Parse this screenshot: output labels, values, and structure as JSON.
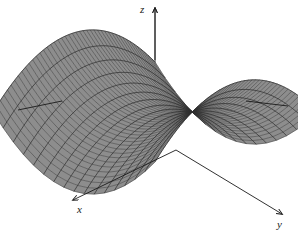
{
  "figure": {
    "title": "",
    "surface_name": "hyperbolic-paraboloid-saddle",
    "background_color": "#ffffff"
  },
  "axes": {
    "x": {
      "label": "x",
      "label_x": 77,
      "label_y": 213,
      "arrow_from": [
        176,
        150
      ],
      "arrow_to": [
        73,
        200
      ]
    },
    "y": {
      "label": "y",
      "label_x": 277,
      "label_y": 228,
      "arrow_from": [
        176,
        150
      ],
      "arrow_to": [
        282,
        214
      ]
    },
    "z": {
      "label": "z",
      "label_x": 140,
      "label_y": 13,
      "arrow_from": [
        155,
        97
      ],
      "arrow_to": [
        155,
        8
      ]
    },
    "stub_left": {
      "from": [
        62,
        101
      ],
      "to": [
        18,
        110
      ]
    },
    "stub_right": {
      "from": [
        246,
        101
      ],
      "to": [
        288,
        106
      ]
    }
  },
  "chart_data": {
    "type": "surface",
    "equation": "z = y^2 - x^2",
    "title": "",
    "xlabel": "x",
    "ylabel": "y",
    "zlabel": "z",
    "xlim": [
      -1,
      1
    ],
    "ylim": [
      -1,
      1
    ],
    "zlim": [
      -1,
      1
    ],
    "grid": true,
    "legend": false,
    "mesh": {
      "u_lines": 46,
      "v_lines": 17
    },
    "colors": {
      "surface_fill": "#8d8d8d",
      "surface_fill_light": "#a9a9a9",
      "mesh_line": "#2f2f2f",
      "axis_line": "#1a1a1a",
      "label_text": "#1a1a1a"
    },
    "projection": {
      "azimuth_deg": -60,
      "elevation_deg": 22,
      "scale": 118
    }
  }
}
